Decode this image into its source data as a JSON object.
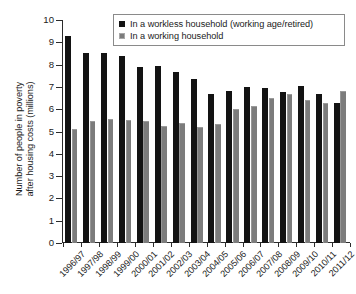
{
  "chart_data": {
    "type": "bar",
    "title": "",
    "xlabel": "",
    "ylabel": "Number of people in poverty\nafter housing costs (millions)",
    "ylim": [
      0,
      10
    ],
    "ytick_labels": [
      "10",
      "9",
      "8",
      "7",
      "6",
      "5",
      "4",
      "3",
      "2",
      "1",
      "0"
    ],
    "ytick_values": [
      10,
      9,
      8,
      7,
      6,
      5,
      4,
      3,
      2,
      1,
      0
    ],
    "grid": false,
    "legend_position": "top-right",
    "categories": [
      "1996/97",
      "1997/98",
      "1998/99",
      "1999/00",
      "2000/01",
      "2001/02",
      "2002/03",
      "2003/04",
      "2004/05",
      "2005/06",
      "2006/07",
      "2007/08",
      "2008/09",
      "2009/10",
      "2010/11",
      "2011/12"
    ],
    "series": [
      {
        "name": "In a workless household (working age/retired)",
        "color": "#131313",
        "values": [
          9.3,
          8.5,
          8.5,
          8.4,
          7.9,
          7.95,
          7.65,
          7.35,
          6.7,
          6.8,
          7.0,
          6.95,
          6.75,
          7.05,
          6.7,
          6.3
        ]
      },
      {
        "name": "In a working household",
        "color": "#7c7c7c",
        "values": [
          5.1,
          5.45,
          5.55,
          5.5,
          5.45,
          5.25,
          5.4,
          5.2,
          5.35,
          6.0,
          6.15,
          6.5,
          6.7,
          6.4,
          6.3,
          6.8
        ]
      }
    ]
  },
  "legend": {
    "items": [
      {
        "label": "In a workless household (working age/retired)",
        "swatch": "dark"
      },
      {
        "label": "In a working household",
        "swatch": "light"
      }
    ]
  }
}
